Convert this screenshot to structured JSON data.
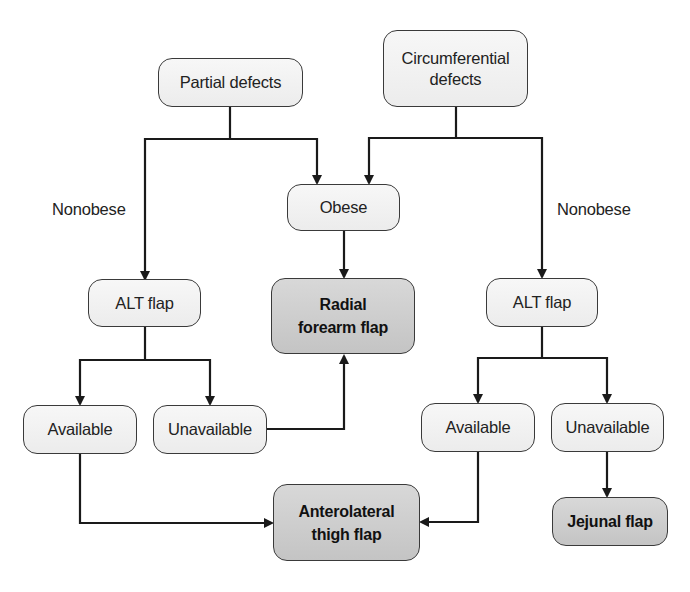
{
  "diagram": {
    "type": "flowchart",
    "nodes": {
      "partial_defects": "Partial defects",
      "circumferential_defects_line1": "Circumferential",
      "circumferential_defects_line2": "defects",
      "obese": "Obese",
      "radial_forearm_flap_line1": "Radial",
      "radial_forearm_flap_line2": "forearm flap",
      "alt_flap_left": "ALT flap",
      "alt_flap_right": "ALT flap",
      "available_left": "Available",
      "unavailable_left": "Unavailable",
      "available_right": "Available",
      "unavailable_right": "Unavailable",
      "anterolateral_thigh_flap_line1": "Anterolateral",
      "anterolateral_thigh_flap_line2": "thigh flap",
      "jejunal_flap": "Jejunal flap"
    },
    "edge_labels": {
      "nonobese_left": "Nonobese",
      "nonobese_right": "Nonobese"
    },
    "edges": [
      {
        "from": "Partial defects",
        "to": "ALT flap (left)",
        "label": "Nonobese"
      },
      {
        "from": "Partial defects",
        "to": "Obese"
      },
      {
        "from": "Circumferential defects",
        "to": "Obese"
      },
      {
        "from": "Circumferential defects",
        "to": "ALT flap (right)",
        "label": "Nonobese"
      },
      {
        "from": "Obese",
        "to": "Radial forearm flap"
      },
      {
        "from": "ALT flap (left)",
        "to": "Available (left)"
      },
      {
        "from": "ALT flap (left)",
        "to": "Unavailable (left)"
      },
      {
        "from": "Unavailable (left)",
        "to": "Radial forearm flap"
      },
      {
        "from": "Available (left)",
        "to": "Anterolateral thigh flap"
      },
      {
        "from": "ALT flap (right)",
        "to": "Available (right)"
      },
      {
        "from": "ALT flap (right)",
        "to": "Unavailable (right)"
      },
      {
        "from": "Available (right)",
        "to": "Anterolateral thigh flap"
      },
      {
        "from": "Unavailable (right)",
        "to": "Jejunal flap"
      }
    ],
    "colors": {
      "node_fill": "#f2f2f2",
      "outcome_fill": "#cfcfcf",
      "stroke": "#1a1a1a"
    }
  }
}
